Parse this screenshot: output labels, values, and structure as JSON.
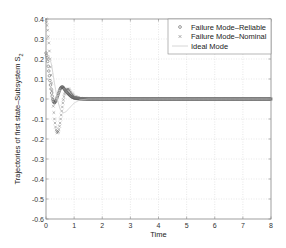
{
  "chart_data": {
    "type": "line",
    "title": "",
    "xlabel": "Time",
    "ylabel": "Trajectories of first state–Subsystem S",
    "ylabel_subscript": "2",
    "xlim": [
      0,
      8
    ],
    "ylim": [
      -0.6,
      0.4
    ],
    "xticks": [
      0,
      1,
      2,
      3,
      4,
      5,
      6,
      7,
      8
    ],
    "yticks": [
      0.4,
      0.3,
      0.2,
      0.1,
      0,
      -0.1,
      -0.2,
      -0.3,
      -0.4,
      -0.5,
      -0.6
    ],
    "ytick_labels": [
      "0.4",
      "0.3",
      "0.2",
      "0.1",
      "0",
      "-0.1",
      "-0.2",
      "-0.3",
      "-0.4",
      "-0.5",
      "-0.6"
    ],
    "grid": true,
    "legend_position": "upper right",
    "series": [
      {
        "name": "Failure Mode–Reliable",
        "marker": "o",
        "color": "#555555",
        "x": [
          0,
          0.05,
          0.1,
          0.15,
          0.2,
          0.25,
          0.3,
          0.35,
          0.4,
          0.45,
          0.5,
          0.55,
          0.6,
          0.65,
          0.7,
          0.8,
          0.9,
          1.0,
          1.2,
          1.5,
          2,
          3,
          4,
          5,
          6,
          7,
          8
        ],
        "y": [
          0.23,
          0.2,
          0.14,
          0.08,
          0.03,
          -0.01,
          -0.02,
          -0.01,
          0.01,
          0.03,
          0.05,
          0.06,
          0.06,
          0.05,
          0.04,
          0.025,
          0.012,
          0.005,
          0.001,
          0,
          0,
          0,
          0,
          0,
          0,
          0,
          0
        ]
      },
      {
        "name": "Failure Mode–Nominal",
        "marker": "x",
        "color": "#777777",
        "x": [
          0,
          0.05,
          0.1,
          0.15,
          0.2,
          0.25,
          0.3,
          0.35,
          0.4,
          0.45,
          0.5,
          0.55,
          0.6,
          0.65,
          0.7,
          0.8,
          0.9,
          1.0,
          1.2,
          1.5,
          2,
          3,
          4,
          5,
          6,
          7,
          8
        ],
        "y": [
          0.4,
          0.36,
          0.28,
          0.18,
          0.08,
          -0.02,
          -0.1,
          -0.15,
          -0.17,
          -0.16,
          -0.12,
          -0.07,
          -0.02,
          0.02,
          0.045,
          0.05,
          0.03,
          0.012,
          0.003,
          0,
          0,
          0,
          0,
          0,
          0,
          0,
          0
        ]
      },
      {
        "name": "Ideal Mode",
        "marker": "none",
        "color": "#cccccc",
        "x": [
          0,
          0.1,
          0.2,
          0.3,
          0.4,
          0.5,
          0.6,
          0.7,
          0.8,
          0.9,
          1.0,
          1.2,
          1.5,
          2,
          3,
          4,
          5,
          6,
          7,
          8
        ],
        "y": [
          0.2,
          0.22,
          0.17,
          0.08,
          0.0,
          -0.05,
          -0.07,
          -0.065,
          -0.05,
          -0.035,
          -0.02,
          -0.005,
          0,
          0,
          0,
          0,
          0,
          0,
          0,
          0
        ]
      }
    ]
  },
  "legend": {
    "items": [
      {
        "label": "Failure Mode–Reliable",
        "marker": "o"
      },
      {
        "label": "Failure Mode–Nominal",
        "marker": "x"
      },
      {
        "label": "Ideal Mode",
        "marker": "line"
      }
    ]
  },
  "colors": {
    "axis": "#888888",
    "grid": "#d8d8d8",
    "reliable": "#555555",
    "nominal": "#777777",
    "ideal": "#cccccc"
  }
}
